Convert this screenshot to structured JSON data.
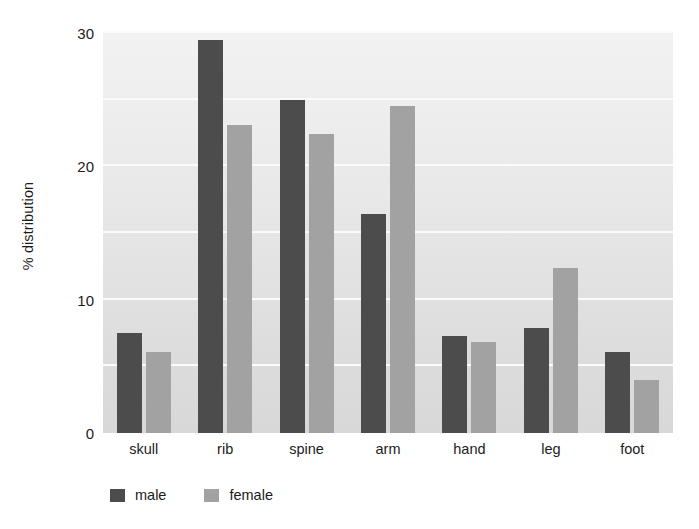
{
  "chart_data": {
    "type": "bar",
    "title": "",
    "subtitle": "",
    "xlabel": "",
    "ylabel": "% distribution",
    "categories": [
      "skull",
      "rib",
      "spine",
      "arm",
      "hand",
      "leg",
      "foot"
    ],
    "series": [
      {
        "name": "male",
        "color": "#4c4c4c",
        "values": [
          7.5,
          29.5,
          25.0,
          16.4,
          7.3,
          7.9,
          6.1
        ]
      },
      {
        "name": "female",
        "color": "#a2a2a2",
        "values": [
          6.1,
          23.1,
          22.4,
          24.5,
          6.8,
          12.4,
          4.0
        ]
      }
    ],
    "ylim": [
      0,
      30
    ],
    "yticks": [
      0,
      10,
      20,
      30
    ],
    "ytick_labels": [
      "0",
      "10",
      "20",
      "30"
    ],
    "gridlines": [
      5,
      10,
      15,
      20,
      25,
      30
    ],
    "grid": true,
    "grid_color": "#fbfbfb",
    "legend_position": "bottom-left",
    "plot_background": "#e9e9e9"
  },
  "axis": {
    "y_title": "% distribution"
  },
  "legend": {
    "items": [
      {
        "label": "male"
      },
      {
        "label": "female"
      }
    ]
  }
}
